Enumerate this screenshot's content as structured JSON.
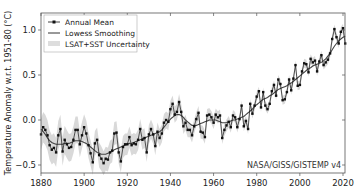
{
  "chart_data": {
    "type": "line",
    "title": "",
    "xlabel": "",
    "ylabel": "Temperature Anomaly w.r.t. 1951-80 (°C)",
    "xlim": [
      1880,
      2022
    ],
    "ylim": [
      -0.6,
      1.2
    ],
    "xticks": [
      1880,
      1900,
      1920,
      1940,
      1960,
      1980,
      2000,
      2020
    ],
    "yticks": [
      -0.5,
      0.0,
      0.5,
      1.0
    ],
    "ytick_labels": [
      "−0.5",
      "0.0",
      "0.5",
      "1.0"
    ],
    "grid": false,
    "legend_position": "upper left",
    "legend": [
      "Annual Mean",
      "Lowess Smoothing",
      "LSAT+SST Uncertainty"
    ],
    "annotation": "NASA/GISS/GISTEMP v4",
    "x": [
      1880,
      1881,
      1882,
      1883,
      1884,
      1885,
      1886,
      1887,
      1888,
      1889,
      1890,
      1891,
      1892,
      1893,
      1894,
      1895,
      1896,
      1897,
      1898,
      1899,
      1900,
      1901,
      1902,
      1903,
      1904,
      1905,
      1906,
      1907,
      1908,
      1909,
      1910,
      1911,
      1912,
      1913,
      1914,
      1915,
      1916,
      1917,
      1918,
      1919,
      1920,
      1921,
      1922,
      1923,
      1924,
      1925,
      1926,
      1927,
      1928,
      1929,
      1930,
      1931,
      1932,
      1933,
      1934,
      1935,
      1936,
      1937,
      1938,
      1939,
      1940,
      1941,
      1942,
      1943,
      1944,
      1945,
      1946,
      1947,
      1948,
      1949,
      1950,
      1951,
      1952,
      1953,
      1954,
      1955,
      1956,
      1957,
      1958,
      1959,
      1960,
      1961,
      1962,
      1963,
      1964,
      1965,
      1966,
      1967,
      1968,
      1969,
      1970,
      1971,
      1972,
      1973,
      1974,
      1975,
      1976,
      1977,
      1978,
      1979,
      1980,
      1981,
      1982,
      1983,
      1984,
      1985,
      1986,
      1987,
      1988,
      1989,
      1990,
      1991,
      1992,
      1993,
      1994,
      1995,
      1996,
      1997,
      1998,
      1999,
      2000,
      2001,
      2002,
      2003,
      2004,
      2005,
      2006,
      2007,
      2008,
      2009,
      2010,
      2011,
      2012,
      2013,
      2014,
      2015,
      2016,
      2017,
      2018,
      2019,
      2020,
      2021
    ],
    "series": [
      {
        "name": "Annual Mean",
        "values": [
          -0.16,
          -0.08,
          -0.11,
          -0.17,
          -0.28,
          -0.33,
          -0.31,
          -0.36,
          -0.17,
          -0.1,
          -0.35,
          -0.22,
          -0.27,
          -0.31,
          -0.3,
          -0.22,
          -0.11,
          -0.11,
          -0.27,
          -0.17,
          -0.08,
          -0.15,
          -0.28,
          -0.37,
          -0.47,
          -0.26,
          -0.22,
          -0.39,
          -0.43,
          -0.48,
          -0.43,
          -0.44,
          -0.36,
          -0.34,
          -0.15,
          -0.14,
          -0.36,
          -0.46,
          -0.3,
          -0.27,
          -0.27,
          -0.19,
          -0.28,
          -0.26,
          -0.27,
          -0.22,
          -0.1,
          -0.22,
          -0.2,
          -0.36,
          -0.16,
          -0.1,
          -0.16,
          -0.29,
          -0.13,
          -0.2,
          -0.15,
          -0.03,
          0.0,
          -0.02,
          0.12,
          0.18,
          0.06,
          0.09,
          0.2,
          0.09,
          -0.07,
          -0.03,
          -0.11,
          -0.11,
          -0.17,
          -0.07,
          0.01,
          0.08,
          -0.13,
          -0.14,
          -0.19,
          0.05,
          0.06,
          0.03,
          -0.03,
          0.06,
          0.03,
          0.05,
          -0.2,
          -0.11,
          -0.06,
          -0.02,
          -0.08,
          0.05,
          0.03,
          -0.08,
          0.01,
          0.16,
          -0.07,
          -0.01,
          -0.1,
          0.18,
          0.07,
          0.16,
          0.26,
          0.32,
          0.14,
          0.31,
          0.16,
          0.12,
          0.18,
          0.32,
          0.39,
          0.27,
          0.45,
          0.4,
          0.22,
          0.23,
          0.31,
          0.45,
          0.33,
          0.46,
          0.61,
          0.38,
          0.39,
          0.54,
          0.63,
          0.62,
          0.53,
          0.68,
          0.64,
          0.66,
          0.54,
          0.65,
          0.72,
          0.61,
          0.64,
          0.67,
          0.74,
          0.9,
          1.01,
          0.92,
          0.85,
          0.98,
          1.02,
          0.85
        ]
      },
      {
        "name": "Lowess Smoothing",
        "values": [
          -0.1,
          -0.13,
          -0.16,
          -0.2,
          -0.23,
          -0.25,
          -0.26,
          -0.27,
          -0.27,
          -0.27,
          -0.27,
          -0.26,
          -0.26,
          -0.26,
          -0.25,
          -0.24,
          -0.23,
          -0.23,
          -0.23,
          -0.24,
          -0.25,
          -0.26,
          -0.28,
          -0.3,
          -0.32,
          -0.34,
          -0.36,
          -0.37,
          -0.38,
          -0.38,
          -0.38,
          -0.37,
          -0.36,
          -0.35,
          -0.33,
          -0.32,
          -0.31,
          -0.3,
          -0.29,
          -0.28,
          -0.27,
          -0.26,
          -0.26,
          -0.25,
          -0.24,
          -0.23,
          -0.22,
          -0.21,
          -0.2,
          -0.19,
          -0.18,
          -0.17,
          -0.16,
          -0.15,
          -0.14,
          -0.13,
          -0.11,
          -0.08,
          -0.05,
          -0.02,
          0.01,
          0.03,
          0.05,
          0.06,
          0.06,
          0.05,
          0.03,
          0.0,
          -0.02,
          -0.04,
          -0.06,
          -0.06,
          -0.06,
          -0.05,
          -0.04,
          -0.03,
          -0.02,
          -0.01,
          0.0,
          0.0,
          0.0,
          0.0,
          -0.01,
          -0.02,
          -0.03,
          -0.03,
          -0.03,
          -0.02,
          -0.01,
          0.0,
          0.0,
          0.01,
          0.02,
          0.03,
          0.04,
          0.06,
          0.08,
          0.1,
          0.12,
          0.15,
          0.17,
          0.19,
          0.21,
          0.23,
          0.24,
          0.25,
          0.27,
          0.28,
          0.3,
          0.32,
          0.34,
          0.35,
          0.36,
          0.37,
          0.38,
          0.4,
          0.41,
          0.43,
          0.45,
          0.47,
          0.49,
          0.51,
          0.53,
          0.55,
          0.57,
          0.58,
          0.6,
          0.61,
          0.62,
          0.63,
          0.64,
          0.66,
          0.68,
          0.71,
          0.74,
          0.78,
          0.82,
          0.85,
          0.88,
          0.9,
          0.92,
          0.93
        ]
      }
    ],
    "uncertainty_halfwidth": {
      "1880": 0.17,
      "1920": 0.12,
      "1950": 0.08,
      "1980": 0.05,
      "2021": 0.05
    }
  }
}
